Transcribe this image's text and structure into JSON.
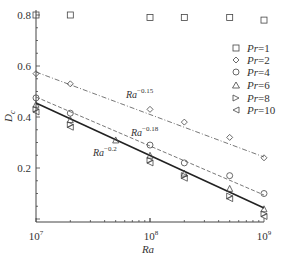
{
  "chart_data": {
    "type": "scatter",
    "title": "",
    "xlabel": "Ra",
    "ylabel": "D_c",
    "xscale": "log",
    "xlim": [
      10000000,
      1000000000
    ],
    "ylim": [
      0,
      0.8
    ],
    "x_ticks": [
      "10^7",
      "10^8",
      "10^9"
    ],
    "y_ticks": [
      "0.2",
      "0.4",
      "0.6",
      "0.8"
    ],
    "grid": false,
    "legend_position": "upper right",
    "series": [
      {
        "name": "Pr=1",
        "marker": "square",
        "x": [
          10000000.0,
          20000000.0,
          100000000.0,
          200000000.0,
          500000000.0,
          1000000000.0
        ],
        "y": [
          0.8,
          0.8,
          0.79,
          0.79,
          0.79,
          0.78
        ]
      },
      {
        "name": "Pr=2",
        "marker": "diamond",
        "x": [
          10000000.0,
          20000000.0,
          100000000.0,
          200000000.0,
          500000000.0,
          1000000000.0
        ],
        "y": [
          0.57,
          0.53,
          0.43,
          0.38,
          0.32,
          0.24
        ]
      },
      {
        "name": "Pr=4",
        "marker": "circle",
        "x": [
          10000000.0,
          20000000.0,
          100000000.0,
          200000000.0,
          500000000.0,
          1000000000.0
        ],
        "y": [
          0.475,
          0.415,
          0.29,
          0.22,
          0.17,
          0.1
        ]
      },
      {
        "name": "Pr=6",
        "marker": "triangle-up",
        "x": [
          10000000.0,
          20000000.0,
          50000000.0,
          100000000.0,
          200000000.0,
          500000000.0,
          1000000000.0
        ],
        "y": [
          0.45,
          0.39,
          0.31,
          0.25,
          0.18,
          0.12,
          0.04
        ]
      },
      {
        "name": "Pr=8",
        "marker": "triangle-right",
        "x": [
          10000000.0,
          20000000.0,
          100000000.0,
          200000000.0,
          500000000.0,
          1000000000.0
        ],
        "y": [
          0.43,
          0.37,
          0.23,
          0.17,
          0.09,
          0.02
        ]
      },
      {
        "name": "Pr=10",
        "marker": "triangle-left",
        "x": [
          10000000.0,
          20000000.0,
          100000000.0,
          200000000.0,
          500000000.0,
          1000000000.0
        ],
        "y": [
          0.42,
          0.36,
          0.22,
          0.16,
          0.08,
          0.01
        ]
      }
    ],
    "fit_lines": [
      {
        "label": "Ra^-0.15",
        "base": "Ra",
        "exponent": "−0.15",
        "style": "dash-dot",
        "x": [
          10000000.0,
          1000000000.0
        ],
        "y": [
          0.57,
          0.24
        ]
      },
      {
        "label": "Ra^-0.18",
        "base": "Ra",
        "exponent": "−0.18",
        "style": "dashed",
        "x": [
          10000000.0,
          1000000000.0
        ],
        "y": [
          0.48,
          0.1
        ]
      },
      {
        "label": "Ra^-0.2",
        "base": "Ra",
        "exponent": "−0.2",
        "style": "solid-thick",
        "x": [
          10000000.0,
          1000000000.0
        ],
        "y": [
          0.455,
          0.045
        ]
      }
    ]
  },
  "axis": {
    "ylabel_main": "D",
    "ylabel_sub": "c",
    "xlabel": "Ra",
    "xtick_base": "10",
    "xtick_exps": [
      "7",
      "8",
      "9"
    ],
    "yticks": [
      "0.2",
      "0.4",
      "0.6",
      "0.8"
    ]
  },
  "legend": [
    {
      "pr": "Pr",
      "eq": "=1"
    },
    {
      "pr": "Pr",
      "eq": "=2"
    },
    {
      "pr": "Pr",
      "eq": "=4"
    },
    {
      "pr": "Pr",
      "eq": "=6"
    },
    {
      "pr": "Pr",
      "eq": "=8"
    },
    {
      "pr": "Pr",
      "eq": "=10"
    }
  ],
  "annotations": {
    "l15_base": "Ra",
    "l15_exp": "−0.15",
    "l18_base": "Ra",
    "l18_exp": "−0.18",
    "l20_base": "Ra",
    "l20_exp": "−0.2"
  }
}
